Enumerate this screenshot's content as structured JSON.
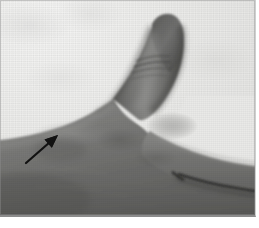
{
  "figure": {
    "kind": "clinical-photograph",
    "modality": "grayscale photograph",
    "subject": "right hand, radial/dorsal view with thumb extended upward",
    "caption": "",
    "width_px": 259,
    "height_px": 228
  },
  "plate": {
    "name": "photo-plate",
    "left_px": 0,
    "top_px": 0,
    "width_px": 256,
    "height_px": 217,
    "border_color": "#8c8c8c",
    "page_background": "#ffffff"
  },
  "palette": {
    "page_white": "#ffffff",
    "backdrop_light": "#ededec",
    "backdrop_mid": "#e2e2e0",
    "skin_light": "#9a9a98",
    "skin_mid": "#7b7b79",
    "skin_base": "#6c6c6a",
    "skin_shadow": "#565654",
    "skin_deep_shadow": "#3f3f3e",
    "crease_dark": "#2e2e2d",
    "arrow_black": "#121212"
  },
  "anatomy": {
    "regions": [
      {
        "id": "thumb-distal-phalanx",
        "label": "Thumb distal phalanx",
        "note": "extended vertically, tip rounded"
      },
      {
        "id": "thumb-nail-fold",
        "label": "Thumb tip"
      },
      {
        "id": "interphalangeal-creases",
        "label": "Interphalangeal skin creases",
        "count": 4
      },
      {
        "id": "thumb-proximal-phalanx",
        "label": "Thumb proximal phalanx"
      },
      {
        "id": "first-web-space",
        "label": "First web space"
      },
      {
        "id": "thenar-eminence",
        "label": "Thenar eminence"
      },
      {
        "id": "first-dorsal-interosseous",
        "label": "First dorsal interosseous region"
      },
      {
        "id": "dorsum-of-hand",
        "label": "Dorsum of hand"
      },
      {
        "id": "index-finger",
        "label": "Index finger"
      },
      {
        "id": "index-middle-cleft",
        "label": "Cleft between index and middle finger"
      }
    ]
  },
  "annotation": {
    "arrow": {
      "name": "pointer-arrow",
      "color": "#121212",
      "tail_x": 26,
      "tail_y": 163,
      "tip_x": 58,
      "tip_y": 135,
      "direction": "up-right",
      "shaft_width_px": 2.2,
      "head_length_px": 13,
      "head_width_px": 11,
      "points_to": "first dorsal interosseous / thenar wasting"
    },
    "labels": []
  },
  "texture": {
    "grain_opacity": 0.3,
    "vignette": true
  }
}
